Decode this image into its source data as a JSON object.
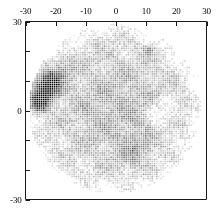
{
  "figure": {
    "title": "",
    "background": "#ffffff",
    "frame_color": "#1a1a1a",
    "marker_color": "#000000"
  },
  "chart_data": {
    "type": "scatter",
    "title": "",
    "xlabel": "",
    "ylabel": "",
    "xlim": [
      -30,
      30
    ],
    "ylim": [
      -30,
      30
    ],
    "grid": false,
    "legend": null,
    "marker": "square",
    "marker_size_px": 1.6,
    "grid_spacing_units": 0.72,
    "x_ticks": [
      -30,
      -20,
      -10,
      0,
      10,
      20,
      30
    ],
    "x_tick_labels": [
      "-30",
      "-20",
      "-10",
      "0",
      "10",
      "20",
      "30"
    ],
    "x_tick_position": "top",
    "y_ticks": [
      -30,
      -20,
      -10,
      0,
      10,
      20,
      30
    ],
    "y_tick_labels": [
      "-30",
      "",
      "",
      "0",
      "",
      "",
      "-30"
    ],
    "y_labeled_ticks": [
      {
        "value": 30,
        "label": "30"
      },
      {
        "value": 0,
        "label": "0"
      },
      {
        "value": -30,
        "label": "-30"
      }
    ],
    "y_tick_position": "left",
    "disc": {
      "center_x": -0.5,
      "center_y": 0.5,
      "radius": 28.5
    },
    "features": [
      {
        "name": "dark-cluster-upper-left",
        "center_x": -23.5,
        "center_y": 7.0,
        "radius": 7.0,
        "intensity": 0.95
      },
      {
        "name": "dark-extension-left",
        "center_x": -26.0,
        "center_y": 2.0,
        "radius": 5.0,
        "intensity": 0.9
      },
      {
        "name": "grey-halo-upper-left",
        "center_x": -21.0,
        "center_y": 12.0,
        "radius": 9.0,
        "intensity": 0.45
      },
      {
        "name": "bright-void-right",
        "center_x": 16.0,
        "center_y": -1.0,
        "radius": 6.5,
        "intensity": -1.0
      },
      {
        "name": "grey-streak-upper-right",
        "center_x": 11.0,
        "center_y": 20.5,
        "radius": 2.5,
        "intensity": 0.35
      },
      {
        "name": "faint-streak-lower-right",
        "center_x": 6.0,
        "center_y": -14.0,
        "radius": 9.0,
        "intensity": 0.22
      }
    ],
    "series": [
      {
        "name": "field",
        "point_count_approx": 4900,
        "value_range": [
          0.0,
          1.0
        ],
        "colormap": "greyscale"
      }
    ]
  },
  "axes": {
    "top": {
      "name": "x-axis-top",
      "ticks": [
        {
          "label": "-30",
          "value": -30
        },
        {
          "label": "-20",
          "value": -20
        },
        {
          "label": "-10",
          "value": -10
        },
        {
          "label": "0",
          "value": 0
        },
        {
          "label": "10",
          "value": 10
        },
        {
          "label": "20",
          "value": 20
        },
        {
          "label": "30",
          "value": 30
        }
      ]
    },
    "left": {
      "name": "y-axis-left",
      "ticks": [
        {
          "label": "30",
          "value": 30
        },
        {
          "label": "",
          "value": 20
        },
        {
          "label": "",
          "value": 10
        },
        {
          "label": "0",
          "value": 0
        },
        {
          "label": "",
          "value": -10
        },
        {
          "label": "",
          "value": -20
        },
        {
          "label": "-30",
          "value": -30
        }
      ]
    }
  }
}
